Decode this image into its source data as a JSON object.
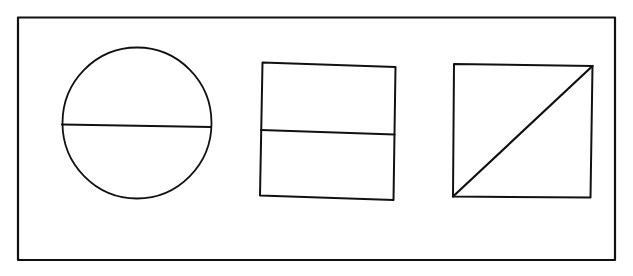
{
  "diagram": {
    "title": "",
    "colors": {
      "stroke": "#111111",
      "background": "#ffffff"
    },
    "figures": [
      {
        "id": "circle",
        "shape": "circle",
        "divider": "horizontal",
        "parts": 2
      },
      {
        "id": "square",
        "shape": "square",
        "divider": "horizontal",
        "parts": 2
      },
      {
        "id": "square-diagonal",
        "shape": "square",
        "divider": "diagonal",
        "parts": 2
      }
    ]
  }
}
